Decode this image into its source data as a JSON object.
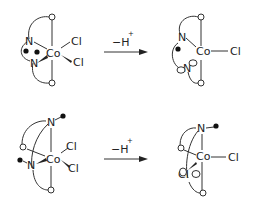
{
  "diagram": {
    "type": "reaction-scheme",
    "reactions": [
      {
        "id": "top",
        "reagent": {
          "prefix": "−H",
          "superscript": "+"
        },
        "reactant": {
          "metal": "Co",
          "ligands": [
            "N",
            "N",
            "Cl",
            "Cl"
          ]
        },
        "product": {
          "metal": "Co",
          "ligands": [
            "N",
            "N",
            "Cl"
          ]
        }
      },
      {
        "id": "bottom",
        "reagent": {
          "prefix": "−H",
          "superscript": "+"
        },
        "reactant": {
          "metal": "Co",
          "ligands": [
            "N",
            "N",
            "Cl",
            "Cl"
          ]
        },
        "product": {
          "metal": "Co",
          "ligands": [
            "N",
            "N",
            "Cl"
          ]
        }
      }
    ],
    "labels": {
      "co": "Co",
      "n": "N",
      "cl": "Cl"
    }
  }
}
